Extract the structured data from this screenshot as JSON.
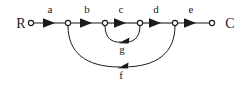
{
  "diagram": {
    "type": "directed-graph",
    "title": "",
    "background_color": "#ffffff",
    "stroke_color": "#1a1a1a",
    "terminals": {
      "start": {
        "label": "R",
        "x": 21,
        "y": 28
      },
      "end": {
        "label": "C",
        "x": 230,
        "y": 28
      }
    },
    "nodes": [
      {
        "id": "n0",
        "x": 31,
        "y": 23,
        "r": 2.6
      },
      {
        "id": "n1",
        "x": 68,
        "y": 23,
        "r": 2.6
      },
      {
        "id": "n2",
        "x": 105,
        "y": 23,
        "r": 2.6
      },
      {
        "id": "n3",
        "x": 140,
        "y": 23,
        "r": 2.6
      },
      {
        "id": "n4",
        "x": 175,
        "y": 23,
        "r": 2.6
      },
      {
        "id": "n5",
        "x": 212,
        "y": 23,
        "r": 2.6
      }
    ],
    "edges": [
      {
        "id": "e_a",
        "label": "a",
        "from": "n0",
        "to": "n1",
        "label_x": 50,
        "label_y": 13,
        "shape": "straight"
      },
      {
        "id": "e_b",
        "label": "b",
        "from": "n1",
        "to": "n2",
        "label_x": 87,
        "label_y": 13,
        "shape": "straight"
      },
      {
        "id": "e_c",
        "label": "c",
        "from": "n2",
        "to": "n3",
        "label_x": 121,
        "label_y": 13,
        "shape": "straight"
      },
      {
        "id": "e_d",
        "label": "d",
        "from": "n3",
        "to": "n4",
        "label_x": 156,
        "label_y": 13,
        "shape": "straight"
      },
      {
        "id": "e_e",
        "label": "e",
        "from": "n4",
        "to": "n5",
        "label_x": 191,
        "label_y": 13,
        "shape": "straight"
      },
      {
        "id": "e_g",
        "label": "g",
        "from": "n3",
        "to": "n2",
        "label_x": 122,
        "label_y": 53,
        "shape": "arc-below",
        "arrow_x": 124,
        "arrow_y": 41
      },
      {
        "id": "e_f",
        "label": "f",
        "from": "n4",
        "to": "n1",
        "label_x": 121,
        "label_y": 79,
        "shape": "arc-below",
        "arrow_x": 122,
        "arrow_y": 67
      }
    ],
    "icons": {
      "arrowhead": "triangle-right-icon",
      "node": "small-circle-icon"
    }
  }
}
